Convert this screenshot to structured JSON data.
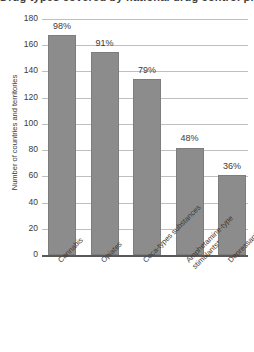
{
  "chart_data": {
    "type": "bar",
    "title": "Drug types covered by national drug control programmes",
    "xlabel": "",
    "ylabel": "Number of countries and territories",
    "ylim": [
      0,
      180
    ],
    "ytick_step": 20,
    "yticks": [
      180,
      160,
      140,
      120,
      100,
      80,
      60,
      40,
      20,
      0
    ],
    "grid": true,
    "legend": "none",
    "bar_color": "#8c8c8c",
    "gridline_color": "#bfbfbf",
    "axis_color": "#595959",
    "categories": [
      "Cannabis",
      "Opiates",
      "Coca-types substances",
      "Amphetamine-type\nstimulants*",
      "Depressants"
    ],
    "values": [
      168,
      155,
      134,
      82,
      61
    ],
    "data_labels": [
      "98%",
      "91%",
      "79%",
      "48%",
      "36%"
    ]
  },
  "axis": {
    "y_title": "Number of countries and territories"
  }
}
